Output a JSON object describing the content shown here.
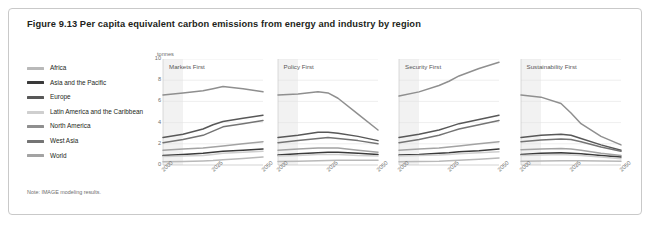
{
  "figure": {
    "title": "Figure 9.13 Per capita equivalent carbon emissions from energy and industry by region",
    "note": "Note: IMAGE modeling results.",
    "units_label": "tonnes"
  },
  "legend": {
    "items": [
      {
        "label": "Africa",
        "color": "#b9b9b9"
      },
      {
        "label": "Asia and the Pacific",
        "color": "#3a3a3a"
      },
      {
        "label": "Europe",
        "color": "#585858"
      },
      {
        "label": "Latin America and the Caribbean",
        "color": "#cfcfcf"
      },
      {
        "label": "North America",
        "color": "#8f8f8f"
      },
      {
        "label": "West Asia",
        "color": "#747474"
      },
      {
        "label": "World",
        "color": "#a3a3a3"
      }
    ]
  },
  "chart_data": {
    "type": "line",
    "title": "Figure 9.13 Per capita equivalent carbon emissions from energy and industry by region",
    "xlabel": "",
    "ylabel": "tonnes",
    "ylim": [
      0,
      10
    ],
    "yticks": [
      0,
      2,
      4,
      6,
      8,
      10
    ],
    "x": [
      2000,
      2010,
      2020,
      2025,
      2030,
      2040,
      2050
    ],
    "xticks": [
      2000,
      2025,
      2050
    ],
    "xtick_labels": [
      "2000",
      "2025",
      "2050"
    ],
    "grid": true,
    "legend_position": "left",
    "shaded_band": {
      "from": 2000,
      "to": 2010,
      "color": "#f2f2f2"
    },
    "panels": [
      {
        "title": "Markets First",
        "series": [
          {
            "name": "North America",
            "color": "#8f8f8f",
            "values": [
              6.6,
              6.8,
              7.0,
              7.2,
              7.4,
              7.2,
              6.9
            ]
          },
          {
            "name": "Europe",
            "color": "#585858",
            "values": [
              2.6,
              2.9,
              3.4,
              3.8,
              4.1,
              4.4,
              4.7
            ]
          },
          {
            "name": "West Asia",
            "color": "#747474",
            "values": [
              2.1,
              2.4,
              2.8,
              3.2,
              3.6,
              3.9,
              4.2
            ]
          },
          {
            "name": "World",
            "color": "#a3a3a3",
            "values": [
              1.4,
              1.5,
              1.6,
              1.7,
              1.8,
              2.0,
              2.2
            ]
          },
          {
            "name": "Asia and the Pacific",
            "color": "#3a3a3a",
            "values": [
              0.9,
              1.0,
              1.1,
              1.2,
              1.3,
              1.4,
              1.5
            ]
          },
          {
            "name": "Latin America and the Caribbean",
            "color": "#cfcfcf",
            "values": [
              0.8,
              0.85,
              0.9,
              1.0,
              1.1,
              1.2,
              1.3
            ]
          },
          {
            "name": "Africa",
            "color": "#b9b9b9",
            "values": [
              0.3,
              0.33,
              0.38,
              0.42,
              0.5,
              0.62,
              0.75
            ]
          }
        ]
      },
      {
        "title": "Policy First",
        "series": [
          {
            "name": "North America",
            "color": "#8f8f8f",
            "values": [
              6.6,
              6.7,
              6.9,
              6.8,
              6.3,
              4.8,
              3.3
            ]
          },
          {
            "name": "Europe",
            "color": "#585858",
            "values": [
              2.6,
              2.8,
              3.1,
              3.1,
              3.0,
              2.7,
              2.3
            ]
          },
          {
            "name": "West Asia",
            "color": "#747474",
            "values": [
              2.1,
              2.3,
              2.5,
              2.6,
              2.5,
              2.3,
              2.0
            ]
          },
          {
            "name": "World",
            "color": "#a3a3a3",
            "values": [
              1.4,
              1.5,
              1.6,
              1.6,
              1.6,
              1.4,
              1.2
            ]
          },
          {
            "name": "Asia and the Pacific",
            "color": "#3a3a3a",
            "values": [
              0.95,
              1.05,
              1.15,
              1.2,
              1.2,
              1.1,
              1.0
            ]
          },
          {
            "name": "Latin America and the Caribbean",
            "color": "#cfcfcf",
            "values": [
              0.85,
              0.9,
              1.0,
              1.0,
              1.0,
              0.9,
              0.85
            ]
          },
          {
            "name": "Africa",
            "color": "#b9b9b9",
            "values": [
              0.32,
              0.35,
              0.4,
              0.42,
              0.45,
              0.45,
              0.45
            ]
          }
        ]
      },
      {
        "title": "Security First",
        "series": [
          {
            "name": "North America",
            "color": "#8f8f8f",
            "values": [
              6.5,
              6.9,
              7.5,
              7.9,
              8.4,
              9.1,
              9.7
            ]
          },
          {
            "name": "Europe",
            "color": "#585858",
            "values": [
              2.6,
              2.9,
              3.3,
              3.6,
              3.9,
              4.3,
              4.7
            ]
          },
          {
            "name": "West Asia",
            "color": "#747474",
            "values": [
              2.1,
              2.4,
              2.8,
              3.1,
              3.4,
              3.8,
              4.2
            ]
          },
          {
            "name": "World",
            "color": "#a3a3a3",
            "values": [
              1.4,
              1.5,
              1.6,
              1.7,
              1.8,
              2.0,
              2.2
            ]
          },
          {
            "name": "Asia and the Pacific",
            "color": "#3a3a3a",
            "values": [
              0.95,
              1.0,
              1.1,
              1.15,
              1.25,
              1.35,
              1.5
            ]
          },
          {
            "name": "Latin America and the Caribbean",
            "color": "#cfcfcf",
            "values": [
              0.85,
              0.9,
              0.95,
              1.0,
              1.05,
              1.15,
              1.25
            ]
          },
          {
            "name": "Africa",
            "color": "#b9b9b9",
            "values": [
              0.3,
              0.33,
              0.36,
              0.4,
              0.45,
              0.55,
              0.65
            ]
          }
        ]
      },
      {
        "title": "Sustainability First",
        "series": [
          {
            "name": "North America",
            "color": "#8f8f8f",
            "values": [
              6.6,
              6.4,
              5.8,
              4.9,
              3.9,
              2.7,
              1.9
            ]
          },
          {
            "name": "Europe",
            "color": "#585858",
            "values": [
              2.6,
              2.8,
              2.9,
              2.8,
              2.5,
              1.9,
              1.4
            ]
          },
          {
            "name": "West Asia",
            "color": "#747474",
            "values": [
              2.2,
              2.35,
              2.45,
              2.4,
              2.2,
              1.7,
              1.3
            ]
          },
          {
            "name": "World",
            "color": "#a3a3a3",
            "values": [
              1.45,
              1.5,
              1.55,
              1.5,
              1.4,
              1.1,
              0.9
            ]
          },
          {
            "name": "Asia and the Pacific",
            "color": "#3a3a3a",
            "values": [
              1.0,
              1.1,
              1.15,
              1.1,
              1.05,
              0.9,
              0.75
            ]
          },
          {
            "name": "Latin America and the Caribbean",
            "color": "#cfcfcf",
            "values": [
              0.9,
              0.95,
              1.0,
              0.95,
              0.9,
              0.75,
              0.6
            ]
          },
          {
            "name": "Africa",
            "color": "#b9b9b9",
            "values": [
              0.35,
              0.38,
              0.4,
              0.4,
              0.4,
              0.38,
              0.35
            ]
          }
        ]
      }
    ]
  }
}
